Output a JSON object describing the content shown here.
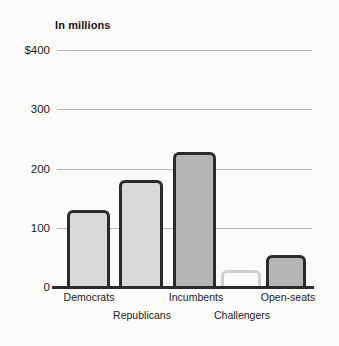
{
  "chart_data": {
    "type": "bar",
    "title": "In millions",
    "xlabel": "",
    "ylabel": "",
    "ylim": [
      0,
      400
    ],
    "yticks": [
      0,
      100,
      200,
      300,
      400
    ],
    "ytick_labels": [
      "0",
      "100",
      "200",
      "300",
      "$400"
    ],
    "grid": true,
    "legend": "none",
    "categories": [
      "Democrats",
      "Republicans",
      "Incumbents",
      "Challengers",
      "Open-seats"
    ],
    "values": [
      130,
      180,
      228,
      28,
      54
    ],
    "bars": [
      {
        "label": "Democrats",
        "value": 130,
        "style": "filled-light",
        "fill": "#d9d9d9",
        "outline": "#2b2b2b"
      },
      {
        "label": "Republicans",
        "value": 180,
        "style": "filled-light",
        "fill": "#d9d9d9",
        "outline": "#2b2b2b"
      },
      {
        "label": "Incumbents",
        "value": 228,
        "style": "filled-dark",
        "fill": "#b5b5b5",
        "outline": "#2b2b2b"
      },
      {
        "label": "Challengers",
        "value": 28,
        "style": "outline-light",
        "fill": "#fcfcfc",
        "outline": "#cfcfcf"
      },
      {
        "label": "Open-seats",
        "value": 54,
        "style": "filled-dark",
        "fill": "#b5b5b5",
        "outline": "#2b2b2b"
      }
    ]
  },
  "axis": {
    "tick_400": "$400",
    "tick_300": "300",
    "tick_200": "200",
    "tick_100": "100",
    "tick_0": "0"
  },
  "xaxis": {
    "democrats": "Democrats",
    "republicans": "Republicans",
    "incumbents": "Incumbents",
    "challengers": "Challengers",
    "open_seats": "Open-seats"
  },
  "colors": {
    "background": "#fbfbfa",
    "gridline": "#b9b9b9",
    "axis": "#2b2b2b",
    "bar_outline_dark": "#2b2b2b",
    "bar_fill_light": "#d9d9d9",
    "bar_fill_dark": "#b5b5b5",
    "bar_outline_light": "#cfcfcf",
    "text": "#1c1c1c"
  }
}
